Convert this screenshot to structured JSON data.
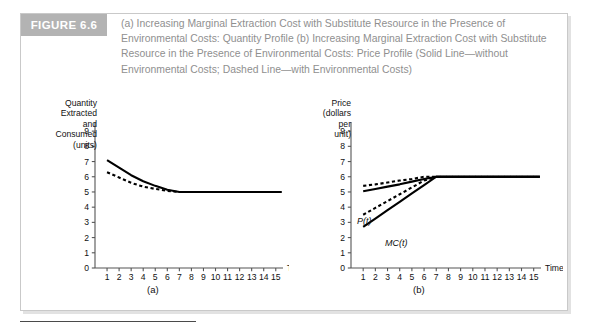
{
  "figure": {
    "label": "FIGURE 6.6",
    "caption": "(a) Increasing Marginal Extraction Cost with Substitute Resource in the Presence of Environmental Costs: Quantity Profile (b) Increasing Marginal Extraction Cost with Substitute Resource in the Presence of Environmental Costs: Price Profile (Solid Line—without Environmental Costs; Dashed Line—with Environmental Costs)",
    "label_bg": "#b3b3b3",
    "label_color": "#ffffff",
    "caption_color": "#8f8f8f",
    "border_color": "#c9c9c9"
  },
  "panel_a": {
    "ylabel": "Quantity\nExtracted\nand\nConsumed\n(units)",
    "xlabel": "Time",
    "caption": "(a)"
  },
  "panel_b": {
    "ylabel": "Price\n(dollars\nper\nunit)",
    "xlabel": "Time",
    "caption": "(b)",
    "annotations": [
      {
        "name": "price-curve-label",
        "text": "P(t)"
      },
      {
        "name": "marginal-cost-curve-label",
        "text": "MC(t)"
      }
    ]
  },
  "chart_data": [
    {
      "type": "line",
      "panel": "(a)",
      "title": "Quantity Profile",
      "xlabel": "Time",
      "ylabel": "Quantity Extracted and Consumed (units)",
      "xlim": [
        0,
        15.6
      ],
      "ylim": [
        0,
        9.6
      ],
      "xticks": [
        1,
        2,
        3,
        4,
        5,
        6,
        7,
        8,
        9,
        10,
        11,
        12,
        13,
        14,
        15
      ],
      "yticks": [
        0,
        1,
        2,
        3,
        4,
        5,
        6,
        7,
        8,
        9
      ],
      "grid": false,
      "legend": "none",
      "series": [
        {
          "name": "Quantity without Environmental Costs",
          "style": "solid",
          "color": "#000000",
          "x": [
            1,
            2,
            3,
            4,
            5,
            6,
            7,
            8,
            9,
            10,
            11,
            12,
            13,
            14,
            15,
            15.5
          ],
          "values": [
            7.1,
            6.6,
            6.1,
            5.7,
            5.4,
            5.15,
            5.0,
            5.0,
            5.0,
            5.0,
            5.0,
            5.0,
            5.0,
            5.0,
            5.0,
            5.0
          ]
        },
        {
          "name": "Quantity with Environmental Costs",
          "style": "dashed",
          "color": "#000000",
          "x": [
            1,
            2,
            3,
            4,
            5,
            6,
            7,
            8,
            9,
            10,
            11,
            12,
            13,
            14,
            15,
            15.5
          ],
          "values": [
            6.3,
            5.95,
            5.6,
            5.35,
            5.2,
            5.07,
            5.0,
            5.0,
            5.0,
            5.0,
            5.0,
            5.0,
            5.0,
            5.0,
            5.0,
            5.0
          ]
        }
      ]
    },
    {
      "type": "line",
      "panel": "(b)",
      "title": "Price Profile",
      "xlabel": "Time",
      "ylabel": "Price (dollars per unit)",
      "xlim": [
        0,
        15.6
      ],
      "ylim": [
        0,
        9.6
      ],
      "xticks": [
        1,
        2,
        3,
        4,
        5,
        6,
        7,
        8,
        9,
        10,
        11,
        12,
        13,
        14,
        15
      ],
      "yticks": [
        0,
        1,
        2,
        3,
        4,
        5,
        6,
        7,
        8,
        9
      ],
      "grid": false,
      "legend": "none",
      "series": [
        {
          "name": "P(t) without Environmental Costs",
          "style": "solid",
          "color": "#000000",
          "x": [
            1,
            2,
            3,
            4,
            5,
            6,
            7,
            8,
            9,
            10,
            11,
            12,
            13,
            14,
            15,
            15.5
          ],
          "values": [
            5.05,
            5.2,
            5.35,
            5.5,
            5.68,
            5.85,
            6.0,
            6.0,
            6.0,
            6.0,
            6.0,
            6.0,
            6.0,
            6.0,
            6.0,
            6.0
          ]
        },
        {
          "name": "P(t) with Environmental Costs",
          "style": "dashed",
          "color": "#000000",
          "x": [
            1,
            2,
            3,
            4,
            5,
            6,
            7,
            8,
            9,
            10,
            11,
            12,
            13,
            14,
            15,
            15.5
          ],
          "values": [
            5.4,
            5.5,
            5.62,
            5.75,
            5.85,
            6.0,
            6.0,
            6.0,
            6.0,
            6.0,
            6.0,
            6.0,
            6.0,
            6.0,
            6.0,
            6.0
          ]
        },
        {
          "name": "MC(t) without Environmental Costs",
          "style": "solid",
          "color": "#000000",
          "x": [
            1,
            2,
            3,
            4,
            5,
            6,
            7,
            8,
            9,
            10,
            11,
            12,
            13,
            14,
            15,
            15.5
          ],
          "values": [
            2.7,
            3.25,
            3.8,
            4.35,
            4.9,
            5.45,
            6.0,
            6.0,
            6.0,
            6.0,
            6.0,
            6.0,
            6.0,
            6.0,
            6.0,
            6.0
          ]
        },
        {
          "name": "MC(t) with Environmental Costs",
          "style": "dashed",
          "color": "#000000",
          "x": [
            1,
            2,
            3,
            4,
            5,
            6,
            7,
            8,
            9,
            10,
            11,
            12,
            13,
            14,
            15,
            15.5
          ],
          "values": [
            3.5,
            3.95,
            4.4,
            4.85,
            5.3,
            5.75,
            6.0,
            6.0,
            6.0,
            6.0,
            6.0,
            6.0,
            6.0,
            6.0,
            6.0,
            6.0
          ]
        }
      ]
    }
  ]
}
